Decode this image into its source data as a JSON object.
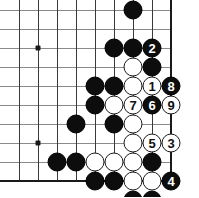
{
  "figure": {
    "type": "go-diagram",
    "board_region": "bottom-right corner",
    "colors": {
      "black_stone": "#0d0d0d",
      "white_stone": "#ffffff",
      "grid_line": "#8a8a8a",
      "edge_line": "#1a1a1a",
      "background": "#ffffff"
    }
  },
  "board": {
    "visible_columns": 9,
    "visible_rows": 10,
    "cell_size_px": 19,
    "origin_x_px": 19,
    "origin_y_px": 10,
    "right_edge_col": 8,
    "bottom_edge_row": 9,
    "star_points": [
      {
        "col": 1,
        "row": 2
      },
      {
        "col": 1,
        "row": 7
      }
    ]
  },
  "stones": [
    {
      "col": 6,
      "row": 0,
      "color": "black",
      "label": ""
    },
    {
      "col": 5,
      "row": 2,
      "color": "black",
      "label": ""
    },
    {
      "col": 6,
      "row": 2,
      "color": "black",
      "label": ""
    },
    {
      "col": 7,
      "row": 2,
      "color": "black",
      "label": "2"
    },
    {
      "col": 6,
      "row": 3,
      "color": "white",
      "label": ""
    },
    {
      "col": 7,
      "row": 3,
      "color": "black",
      "label": ""
    },
    {
      "col": 4,
      "row": 4,
      "color": "black",
      "label": ""
    },
    {
      "col": 5,
      "row": 4,
      "color": "black",
      "label": ""
    },
    {
      "col": 6,
      "row": 4,
      "color": "white",
      "label": ""
    },
    {
      "col": 7,
      "row": 4,
      "color": "white",
      "label": "1"
    },
    {
      "col": 8,
      "row": 4,
      "color": "black",
      "label": "8"
    },
    {
      "col": 4,
      "row": 5,
      "color": "black",
      "label": ""
    },
    {
      "col": 5,
      "row": 5,
      "color": "white",
      "label": ""
    },
    {
      "col": 6,
      "row": 5,
      "color": "white",
      "label": "7"
    },
    {
      "col": 7,
      "row": 5,
      "color": "black",
      "label": "6"
    },
    {
      "col": 8,
      "row": 5,
      "color": "white",
      "label": "9"
    },
    {
      "col": 3,
      "row": 6,
      "color": "black",
      "label": ""
    },
    {
      "col": 5,
      "row": 6,
      "color": "black",
      "label": ""
    },
    {
      "col": 6,
      "row": 6,
      "color": "white",
      "label": ""
    },
    {
      "col": 6,
      "row": 7,
      "color": "white",
      "label": ""
    },
    {
      "col": 7,
      "row": 7,
      "color": "white",
      "label": "5"
    },
    {
      "col": 8,
      "row": 7,
      "color": "white",
      "label": "3"
    },
    {
      "col": 2,
      "row": 8,
      "color": "black",
      "label": ""
    },
    {
      "col": 3,
      "row": 8,
      "color": "black",
      "label": ""
    },
    {
      "col": 4,
      "row": 8,
      "color": "white",
      "label": ""
    },
    {
      "col": 5,
      "row": 8,
      "color": "white",
      "label": ""
    },
    {
      "col": 6,
      "row": 8,
      "color": "white",
      "label": ""
    },
    {
      "col": 7,
      "row": 8,
      "color": "black",
      "label": ""
    },
    {
      "col": 4,
      "row": 9,
      "color": "black",
      "label": ""
    },
    {
      "col": 5,
      "row": 9,
      "color": "black",
      "label": ""
    },
    {
      "col": 6,
      "row": 9,
      "color": "white",
      "label": ""
    },
    {
      "col": 7,
      "row": 9,
      "color": "white",
      "label": ""
    },
    {
      "col": 8,
      "row": 9,
      "color": "black",
      "label": "4"
    },
    {
      "col": 6,
      "row": 10,
      "color": "black",
      "label": ""
    },
    {
      "col": 7,
      "row": 10,
      "color": "black",
      "label": ""
    }
  ],
  "move_sequence": [
    {
      "number": "1",
      "color": "white"
    },
    {
      "number": "2",
      "color": "black"
    },
    {
      "number": "3",
      "color": "white"
    },
    {
      "number": "4",
      "color": "black"
    },
    {
      "number": "5",
      "color": "white"
    },
    {
      "number": "6",
      "color": "black"
    },
    {
      "number": "7",
      "color": "white"
    },
    {
      "number": "8",
      "color": "black"
    },
    {
      "number": "9",
      "color": "white"
    }
  ]
}
